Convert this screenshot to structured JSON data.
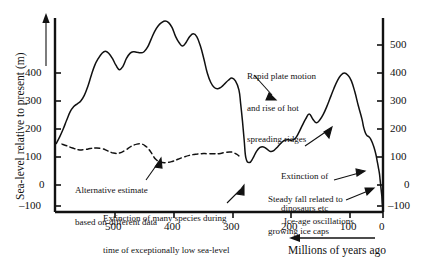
{
  "figure": {
    "background": "#ffffff",
    "line_color": "#111111"
  },
  "axes": {
    "y_left": {
      "title": "Sea-level relative to present (m)",
      "ticks": [
        "400",
        "300",
        "200",
        "100",
        "0",
        "–100"
      ],
      "arrow": "up-arrow-icon"
    },
    "y_right": {
      "ticks": [
        "500",
        "400",
        "300",
        "200",
        "100",
        "0",
        "–100"
      ]
    },
    "x": {
      "ticks": [
        "500",
        "400",
        "300",
        "200",
        "100",
        "0"
      ],
      "title": "Millions of years ago",
      "arrow": "left-arrow-icon"
    }
  },
  "annotations": [
    {
      "name": "alternative-estimate",
      "lines": [
        "Alternative estimate",
        "based on different data"
      ]
    },
    {
      "name": "extinction-many-species",
      "lines": [
        "Extinction of many species during",
        "time of exceptionally low sea-level"
      ]
    },
    {
      "name": "rapid-plate-motion",
      "lines": [
        "Rapid plate motion",
        "and rise of hot",
        "spreading ridges"
      ]
    },
    {
      "name": "extinction-dinosaurs",
      "lines": [
        "Extinction of",
        "dinosaurs etc"
      ]
    },
    {
      "name": "steady-fall-ice-caps",
      "lines": [
        "Steady fall related to",
        "growing ice caps"
      ]
    },
    {
      "name": "ice-age-oscillations",
      "lines": [
        "Ice-age oscillations"
      ]
    }
  ],
  "chart_data": {
    "type": "line",
    "title": "",
    "xlabel": "Millions of years ago",
    "ylabel": "Sea-level relative to present (m)",
    "xlim": [
      560,
      0
    ],
    "ylim": [
      -140,
      620
    ],
    "x_reversed": true,
    "grid": false,
    "legend": "none",
    "series": [
      {
        "name": "Primary sea-level estimate",
        "style": "solid",
        "x": [
          558,
          552,
          546,
          540,
          534,
          528,
          522,
          516,
          510,
          504,
          498,
          492,
          486,
          480,
          474,
          468,
          462,
          456,
          450,
          444,
          438,
          432,
          426,
          420,
          414,
          408,
          402,
          396,
          390,
          384,
          378,
          372,
          366,
          360,
          354,
          348,
          342,
          336,
          330,
          324,
          318,
          312,
          306,
          300,
          294,
          288,
          282,
          276,
          270,
          264,
          258,
          252,
          246,
          243,
          240,
          237,
          234,
          228,
          222,
          216,
          210,
          204,
          198,
          192,
          186,
          180,
          174,
          168,
          162,
          156,
          150,
          144,
          138,
          132,
          126,
          120,
          114,
          108,
          102,
          96,
          90,
          84,
          78,
          72,
          66,
          60,
          54,
          48,
          42,
          36,
          33,
          30,
          27,
          24,
          21,
          18,
          15,
          12,
          10,
          8,
          6,
          5,
          4,
          3,
          2,
          1,
          0
        ],
        "y": [
          148,
          172,
          200,
          232,
          262,
          280,
          290,
          300,
          320,
          352,
          392,
          428,
          452,
          470,
          478,
          470,
          452,
          428,
          412,
          424,
          452,
          470,
          476,
          474,
          472,
          476,
          492,
          520,
          548,
          568,
          580,
          586,
          580,
          562,
          530,
          508,
          496,
          510,
          530,
          540,
          530,
          498,
          452,
          400,
          366,
          348,
          344,
          350,
          362,
          374,
          382,
          372,
          340,
          290,
          230,
          160,
          96,
          80,
          96,
          120,
          134,
          136,
          128,
          120,
          124,
          136,
          150,
          160,
          162,
          160,
          166,
          186,
          212,
          236,
          254,
          236,
          222,
          232,
          252,
          280,
          312,
          344,
          372,
          392,
          400,
          392,
          372,
          332,
          282,
          236,
          206,
          186,
          176,
          172,
          164,
          150,
          132,
          108,
          86,
          64,
          40,
          20,
          0,
          -20,
          -40,
          -70,
          -60
        ],
        "description": "Solid curve: global sea-level curve from late Precambrian/Cambrian to present, peaking near 480 Ma and 340-370 Ma, collapsing near 240 Ma, rising again to ~400 m near 70-80 Ma, then steady fall to present with ice-age oscillations"
      },
      {
        "name": "Alternative estimate based on different data",
        "style": "dashed",
        "x": [
          548,
          540,
          530,
          520,
          510,
          500,
          490,
          480,
          470,
          460,
          450,
          440,
          430,
          420,
          412,
          406,
          400,
          394,
          388,
          380,
          370,
          360,
          350,
          340,
          330,
          320,
          310,
          300,
          290,
          280,
          270,
          262,
          256,
          250,
          246
        ],
        "y": [
          146,
          140,
          132,
          126,
          126,
          130,
          132,
          130,
          122,
          114,
          114,
          124,
          138,
          146,
          146,
          140,
          128,
          110,
          92,
          82,
          80,
          84,
          92,
          100,
          106,
          110,
          112,
          112,
          112,
          112,
          116,
          118,
          116,
          110,
          104
        ],
        "description": "Dashed curve: alternative lower-amplitude sea-level estimate based on different data, spanning ~550 Ma to ~245 Ma"
      }
    ]
  }
}
